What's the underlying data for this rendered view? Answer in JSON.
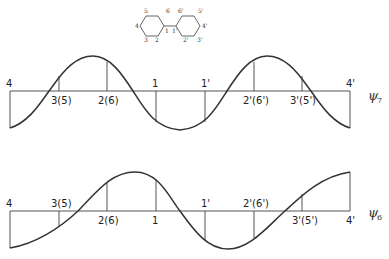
{
  "molecule": {
    "name": "biphenyl",
    "ring_left_labels": [
      "1",
      "2",
      "3",
      "4",
      "5",
      "6"
    ],
    "ring_right_labels": [
      "1'",
      "2'",
      "3'",
      "4'",
      "5'",
      "6'"
    ]
  },
  "panels": [
    {
      "wavefunction": "ψ",
      "subscript": "7",
      "atom_labels": [
        "4",
        "3(5)",
        "2(6)",
        "1",
        "1'",
        "2'(6')",
        "3'(5')",
        "4'"
      ],
      "label_sides": [
        "above",
        "below",
        "below",
        "above",
        "above",
        "below",
        "below",
        "above"
      ]
    },
    {
      "wavefunction": "ψ",
      "subscript": "6",
      "atom_labels": [
        "4",
        "3(5)",
        "2(6)",
        "1",
        "1'",
        "2'(6')",
        "3'(5')",
        "4'"
      ],
      "label_sides": [
        "above",
        "above",
        "below",
        "below",
        "above",
        "above",
        "below",
        "below"
      ]
    }
  ]
}
